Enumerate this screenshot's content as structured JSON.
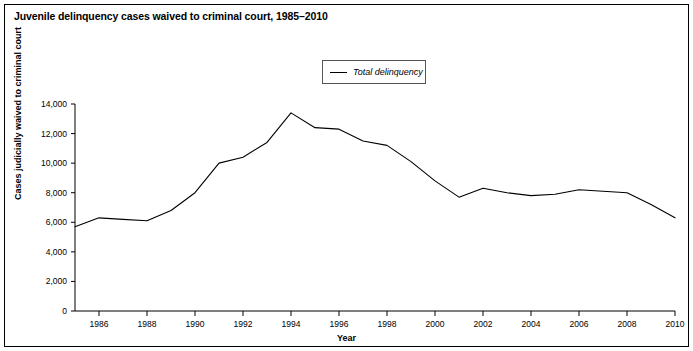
{
  "figure": {
    "title": "Juvenile delinquency cases waived to criminal court, 1985–2010",
    "border_color": "#000000",
    "background_color": "#ffffff"
  },
  "legend": {
    "position": "top-center",
    "entries": [
      {
        "label": "Total delinquency",
        "color": "#000000"
      }
    ]
  },
  "chart_data": {
    "type": "line",
    "title": "Juvenile delinquency cases waived to criminal court, 1985–2010",
    "xlabel": "Year",
    "ylabel": "Cases judicially waived to criminal court",
    "xlim": [
      1985,
      2010
    ],
    "ylim": [
      0,
      14000
    ],
    "grid": false,
    "legend_position": "top-center",
    "x": [
      1985,
      1986,
      1987,
      1988,
      1989,
      1990,
      1991,
      1992,
      1993,
      1994,
      1995,
      1996,
      1997,
      1998,
      1999,
      2000,
      2001,
      2002,
      2003,
      2004,
      2005,
      2006,
      2007,
      2008,
      2009,
      2010
    ],
    "xticks": [
      1986,
      1988,
      1990,
      1992,
      1994,
      1996,
      1998,
      2000,
      2002,
      2004,
      2006,
      2008,
      2010
    ],
    "xticklabels": [
      "1986",
      "1988",
      "1990",
      "1992",
      "1994",
      "1996",
      "1998",
      "2000",
      "2002",
      "2004",
      "2006",
      "2008",
      "2010"
    ],
    "yticks": [
      0,
      2000,
      4000,
      6000,
      8000,
      10000,
      12000,
      14000
    ],
    "yticklabels": [
      "0",
      "2,000",
      "4,000",
      "6,000",
      "8,000",
      "10,000",
      "12,000",
      "14,000"
    ],
    "series": [
      {
        "name": "Total delinquency",
        "color": "#000000",
        "values": [
          5700,
          6300,
          6200,
          6100,
          6800,
          8000,
          10000,
          10400,
          11400,
          13400,
          12400,
          12300,
          11500,
          11200,
          10100,
          8800,
          7700,
          8300,
          8000,
          7800,
          7900,
          8200,
          8100,
          8000,
          7200,
          6300
        ]
      }
    ]
  }
}
